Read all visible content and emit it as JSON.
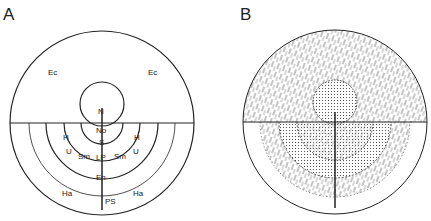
{
  "panels": [
    {
      "id": "A",
      "label": "A",
      "regions": {
        "ec_left": "Ec",
        "ec_right": "Ec",
        "n": "N",
        "no": "No",
        "s": "S",
        "h_left": "H",
        "h_right": "H",
        "u_left": "U",
        "u_right": "U",
        "sm_left": "Sm",
        "sm_right": "Sm",
        "lp": "LP",
        "en": "En",
        "ha_left": "Ha",
        "ha_right": "Ha",
        "ps": "PS"
      }
    },
    {
      "id": "B",
      "label": "B",
      "fills": [
        "hatched",
        "stippled"
      ]
    }
  ],
  "colors": {
    "line": "#222222",
    "background": "#ffffff"
  }
}
